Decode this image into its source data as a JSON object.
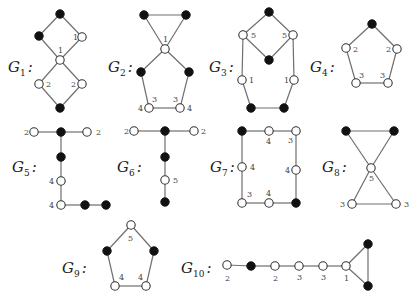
{
  "figure": {
    "width": 417,
    "height": 307,
    "colors": {
      "edge": "#6f6f6f",
      "black_vertex": "#111111",
      "white_vertex": "#ffffff"
    },
    "vertex_radius": 4.2,
    "graphs": [
      {
        "id": "G1",
        "name": "G",
        "sub": "1",
        "label_pos": [
          8,
          72
        ],
        "vertices": [
          {
            "x": 60,
            "y": 14,
            "color": "black"
          },
          {
            "x": 39,
            "y": 36,
            "color": "black"
          },
          {
            "x": 82,
            "y": 37,
            "color": "white",
            "label": "1",
            "lx": 73,
            "ly": 40
          },
          {
            "x": 60,
            "y": 60,
            "color": "white",
            "label": "1",
            "lx": 58,
            "ly": 53
          },
          {
            "x": 39,
            "y": 84,
            "color": "white",
            "label": "2",
            "lx": 46,
            "ly": 87
          },
          {
            "x": 82,
            "y": 84,
            "color": "white",
            "label": "2",
            "lx": 71,
            "ly": 87
          },
          {
            "x": 60,
            "y": 108,
            "color": "black"
          }
        ],
        "edges": [
          [
            0,
            1
          ],
          [
            0,
            2
          ],
          [
            1,
            3
          ],
          [
            2,
            3
          ],
          [
            3,
            4
          ],
          [
            3,
            5
          ],
          [
            4,
            6
          ],
          [
            5,
            6
          ]
        ]
      },
      {
        "id": "G2",
        "name": "G",
        "sub": "2",
        "label_pos": [
          108,
          72
        ],
        "vertices": [
          {
            "x": 144,
            "y": 15,
            "color": "black"
          },
          {
            "x": 186,
            "y": 15,
            "color": "black"
          },
          {
            "x": 165,
            "y": 49,
            "color": "white",
            "label": "1",
            "lx": 163,
            "ly": 42
          },
          {
            "x": 141,
            "y": 72,
            "color": "black"
          },
          {
            "x": 189,
            "y": 72,
            "color": "black"
          },
          {
            "x": 149,
            "y": 108,
            "color": "white",
            "label": "3",
            "lx": 152,
            "ly": 102,
            "label2": "4",
            "l2x": 138,
            "l2y": 111
          },
          {
            "x": 180,
            "y": 108,
            "color": "white",
            "label": "3",
            "lx": 173,
            "ly": 102,
            "label2": "4",
            "l2x": 187,
            "l2y": 111
          }
        ],
        "edges": [
          [
            0,
            1
          ],
          [
            0,
            2
          ],
          [
            1,
            2
          ],
          [
            2,
            3
          ],
          [
            2,
            4
          ],
          [
            3,
            5
          ],
          [
            4,
            6
          ],
          [
            5,
            6
          ]
        ]
      },
      {
        "id": "G3",
        "name": "G",
        "sub": "3",
        "label_pos": [
          209,
          72
        ],
        "vertices": [
          {
            "x": 269,
            "y": 12,
            "color": "black"
          },
          {
            "x": 243,
            "y": 35,
            "color": "white",
            "label": "5",
            "lx": 251,
            "ly": 38
          },
          {
            "x": 293,
            "y": 35,
            "color": "white",
            "label": "5",
            "lx": 282,
            "ly": 38
          },
          {
            "x": 269,
            "y": 60,
            "color": "black"
          },
          {
            "x": 242,
            "y": 80,
            "color": "white",
            "label": "1",
            "lx": 249,
            "ly": 83
          },
          {
            "x": 294,
            "y": 80,
            "color": "white",
            "label": "1",
            "lx": 284,
            "ly": 83
          },
          {
            "x": 251,
            "y": 108,
            "color": "black"
          },
          {
            "x": 284,
            "y": 108,
            "color": "black"
          }
        ],
        "edges": [
          [
            0,
            1
          ],
          [
            0,
            2
          ],
          [
            1,
            3
          ],
          [
            2,
            3
          ],
          [
            1,
            4
          ],
          [
            2,
            5
          ],
          [
            4,
            6
          ],
          [
            5,
            7
          ],
          [
            6,
            7
          ]
        ]
      },
      {
        "id": "G4",
        "name": "G",
        "sub": "4",
        "label_pos": [
          310,
          72
        ],
        "vertices": [
          {
            "x": 372,
            "y": 24,
            "color": "black"
          },
          {
            "x": 346,
            "y": 48,
            "color": "white",
            "label": "2",
            "lx": 353,
            "ly": 52
          },
          {
            "x": 397,
            "y": 49,
            "color": "white",
            "label": "2",
            "lx": 386,
            "ly": 52
          },
          {
            "x": 356,
            "y": 83,
            "color": "white",
            "label": "3",
            "lx": 359,
            "ly": 78
          },
          {
            "x": 388,
            "y": 83,
            "color": "white",
            "label": "3",
            "lx": 380,
            "ly": 78
          }
        ],
        "edges": [
          [
            0,
            1
          ],
          [
            0,
            2
          ],
          [
            1,
            3
          ],
          [
            2,
            4
          ],
          [
            3,
            4
          ]
        ]
      },
      {
        "id": "G5",
        "name": "G",
        "sub": "5",
        "label_pos": [
          12,
          172
        ],
        "vertices": [
          {
            "x": 34,
            "y": 132,
            "color": "white",
            "label": "2",
            "lx": 24,
            "ly": 135
          },
          {
            "x": 61,
            "y": 132,
            "color": "black"
          },
          {
            "x": 87,
            "y": 132,
            "color": "white",
            "label": "2",
            "lx": 96,
            "ly": 135
          },
          {
            "x": 61,
            "y": 157,
            "color": "black"
          },
          {
            "x": 61,
            "y": 181,
            "color": "white",
            "label": "4",
            "lx": 49,
            "ly": 184
          },
          {
            "x": 61,
            "y": 205,
            "color": "white",
            "label": "4",
            "lx": 49,
            "ly": 208
          },
          {
            "x": 85,
            "y": 205,
            "color": "black"
          },
          {
            "x": 106,
            "y": 205,
            "color": "black"
          }
        ],
        "edges": [
          [
            0,
            1
          ],
          [
            1,
            2
          ],
          [
            1,
            3
          ],
          [
            3,
            4
          ],
          [
            4,
            5
          ],
          [
            5,
            6
          ],
          [
            6,
            7
          ]
        ]
      },
      {
        "id": "G6",
        "name": "G",
        "sub": "6",
        "label_pos": [
          117,
          172
        ],
        "vertices": [
          {
            "x": 134,
            "y": 131,
            "color": "white",
            "label": "2",
            "lx": 124,
            "ly": 134
          },
          {
            "x": 165,
            "y": 131,
            "color": "black"
          },
          {
            "x": 194,
            "y": 131,
            "color": "white",
            "label": "2",
            "lx": 201,
            "ly": 134
          },
          {
            "x": 165,
            "y": 157,
            "color": "black"
          },
          {
            "x": 165,
            "y": 180,
            "color": "white",
            "label": "5",
            "lx": 173,
            "ly": 183
          },
          {
            "x": 165,
            "y": 202,
            "color": "black"
          }
        ],
        "edges": [
          [
            0,
            1
          ],
          [
            1,
            2
          ],
          [
            1,
            3
          ],
          [
            3,
            4
          ],
          [
            4,
            5
          ]
        ]
      },
      {
        "id": "G7",
        "name": "G",
        "sub": "7",
        "label_pos": [
          210,
          172
        ],
        "vertices": [
          {
            "x": 242,
            "y": 131,
            "color": "black"
          },
          {
            "x": 269,
            "y": 131,
            "color": "white",
            "label": "4",
            "lx": 266,
            "ly": 144
          },
          {
            "x": 296,
            "y": 131,
            "color": "white",
            "label": "3",
            "lx": 288,
            "ly": 143
          },
          {
            "x": 296,
            "y": 170,
            "color": "white",
            "label": "4",
            "lx": 285,
            "ly": 173
          },
          {
            "x": 296,
            "y": 203,
            "color": "black"
          },
          {
            "x": 242,
            "y": 167,
            "color": "white",
            "label": "4",
            "lx": 250,
            "ly": 170
          },
          {
            "x": 242,
            "y": 203,
            "color": "white",
            "label": "3",
            "lx": 247,
            "ly": 197
          },
          {
            "x": 269,
            "y": 203,
            "color": "white",
            "label": "4",
            "lx": 266,
            "ly": 196
          }
        ],
        "edges": [
          [
            0,
            1
          ],
          [
            1,
            2
          ],
          [
            2,
            3
          ],
          [
            3,
            4
          ],
          [
            0,
            5
          ],
          [
            5,
            6
          ],
          [
            6,
            7
          ],
          [
            7,
            4
          ]
        ]
      },
      {
        "id": "G8",
        "name": "G",
        "sub": "8",
        "label_pos": [
          322,
          172
        ],
        "vertices": [
          {
            "x": 346,
            "y": 131,
            "color": "black"
          },
          {
            "x": 394,
            "y": 131,
            "color": "black"
          },
          {
            "x": 371,
            "y": 168,
            "color": "white",
            "label": "5",
            "lx": 369,
            "ly": 181
          },
          {
            "x": 352,
            "y": 204,
            "color": "white",
            "label": "3",
            "lx": 340,
            "ly": 207
          },
          {
            "x": 396,
            "y": 204,
            "color": "white",
            "label": "3",
            "lx": 404,
            "ly": 207
          }
        ],
        "edges": [
          [
            0,
            1
          ],
          [
            0,
            2
          ],
          [
            1,
            2
          ],
          [
            2,
            3
          ],
          [
            2,
            4
          ],
          [
            3,
            4
          ]
        ]
      },
      {
        "id": "G9",
        "name": "G",
        "sub": "9",
        "label_pos": [
          62,
          273
        ],
        "vertices": [
          {
            "x": 131,
            "y": 225,
            "color": "white",
            "label": "5",
            "lx": 128,
            "ly": 241
          },
          {
            "x": 107,
            "y": 251,
            "color": "black"
          },
          {
            "x": 154,
            "y": 251,
            "color": "black"
          },
          {
            "x": 115,
            "y": 286,
            "color": "white",
            "label": "4",
            "lx": 119,
            "ly": 280
          },
          {
            "x": 146,
            "y": 286,
            "color": "white",
            "label": "4",
            "lx": 138,
            "ly": 280
          }
        ],
        "edges": [
          [
            0,
            1
          ],
          [
            0,
            2
          ],
          [
            1,
            3
          ],
          [
            2,
            4
          ],
          [
            3,
            4
          ]
        ]
      },
      {
        "id": "G10",
        "name": "G",
        "sub": "10",
        "label_pos": [
          181,
          273
        ],
        "vertices": [
          {
            "x": 227,
            "y": 265,
            "color": "white",
            "label": "2",
            "lx": 225,
            "ly": 281
          },
          {
            "x": 251,
            "y": 266,
            "color": "black"
          },
          {
            "x": 275,
            "y": 266,
            "color": "white",
            "label": "2",
            "lx": 273,
            "ly": 281
          },
          {
            "x": 299,
            "y": 266,
            "color": "white",
            "label": "3",
            "lx": 297,
            "ly": 280
          },
          {
            "x": 323,
            "y": 266,
            "color": "white",
            "label": "3",
            "lx": 321,
            "ly": 280
          },
          {
            "x": 346,
            "y": 266,
            "color": "white",
            "label": "1",
            "lx": 344,
            "ly": 281
          },
          {
            "x": 368,
            "y": 244,
            "color": "black"
          },
          {
            "x": 368,
            "y": 286,
            "color": "black"
          }
        ],
        "edges": [
          [
            0,
            1
          ],
          [
            1,
            2
          ],
          [
            2,
            3
          ],
          [
            3,
            4
          ],
          [
            4,
            5
          ],
          [
            5,
            6
          ],
          [
            5,
            7
          ],
          [
            6,
            7
          ]
        ]
      }
    ]
  }
}
